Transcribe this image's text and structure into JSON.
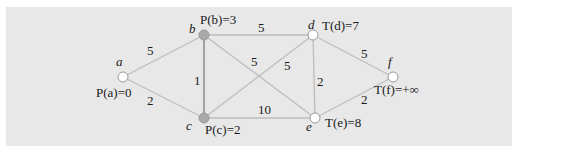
{
  "colors": {
    "panel_bg": "#e8e8e8",
    "edge": "#bdbdbd",
    "edge_highlight": "#9a9a9a",
    "node_unvisited_fill": "#ffffff",
    "node_permanent_fill": "#a9a9a9",
    "node_stroke": "#999999"
  },
  "nodes": [
    {
      "id": "a",
      "name": "a",
      "label": "P(a)=0",
      "state": "permanent-white"
    },
    {
      "id": "b",
      "name": "b",
      "label": "P(b)=3",
      "state": "permanent"
    },
    {
      "id": "c",
      "name": "c",
      "label": "P(c)=2",
      "state": "permanent"
    },
    {
      "id": "d",
      "name": "d",
      "label": "T(d)=7",
      "state": "temporary"
    },
    {
      "id": "e",
      "name": "e",
      "label": "T(e)=8",
      "state": "temporary"
    },
    {
      "id": "f",
      "name": "f",
      "label": "T(f)=+∞",
      "state": "temporary"
    }
  ],
  "edges": [
    {
      "from": "a",
      "to": "b",
      "weight": "5"
    },
    {
      "from": "a",
      "to": "c",
      "weight": "2"
    },
    {
      "from": "b",
      "to": "c",
      "weight": "1"
    },
    {
      "from": "b",
      "to": "d",
      "weight": "5"
    },
    {
      "from": "b",
      "to": "e",
      "weight": "5"
    },
    {
      "from": "c",
      "to": "d",
      "weight": "5"
    },
    {
      "from": "c",
      "to": "e",
      "weight": "10"
    },
    {
      "from": "d",
      "to": "e",
      "weight": "2"
    },
    {
      "from": "d",
      "to": "f",
      "weight": "5"
    },
    {
      "from": "e",
      "to": "f",
      "weight": "2"
    }
  ]
}
